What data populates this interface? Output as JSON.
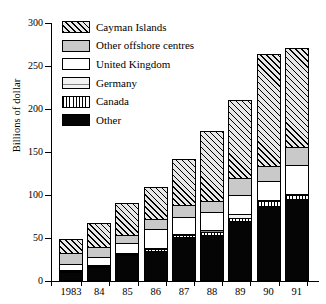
{
  "chart_data": {
    "type": "bar",
    "subtype": "stacked-bar",
    "title": "",
    "xlabel": "",
    "ylabel": "Billions of dollar",
    "categories": [
      "1983",
      "84",
      "85",
      "86",
      "87",
      "88",
      "89",
      "90",
      "91"
    ],
    "ylim": [
      0,
      300
    ],
    "yticks": [
      0,
      50,
      100,
      150,
      200,
      250,
      300
    ],
    "ytick_labels": [
      "0",
      "50",
      "100",
      "150",
      "200",
      "250",
      "300"
    ],
    "grid": false,
    "legend_position": "upper-left-inside",
    "stack_order_bottom_to_top": [
      "Other",
      "Canada",
      "Germany",
      "United Kingdom",
      "Other offshore centres",
      "Cayman Islands"
    ],
    "series": [
      {
        "name": "Other",
        "pattern": "solid-black",
        "color": "#050505",
        "values": [
          11,
          16,
          30,
          35,
          51,
          54,
          70,
          87,
          95
        ]
      },
      {
        "name": "Canada",
        "pattern": "vertical-stripes",
        "color": "#ffffff",
        "values": [
          2,
          2,
          3,
          3,
          4,
          4,
          5,
          7,
          6
        ]
      },
      {
        "name": "Germany",
        "pattern": "fine-horizontal-dots",
        "color": "#f2f2f2",
        "values": [
          1,
          1,
          1,
          1,
          1,
          4,
          5,
          1,
          1
        ]
      },
      {
        "name": "United Kingdom",
        "pattern": "white",
        "color": "#ffffff",
        "values": [
          8,
          11,
          12,
          24,
          21,
          22,
          23,
          23,
          35
        ]
      },
      {
        "name": "Other offshore centres",
        "pattern": "solid-grey",
        "color": "#c9c9c9",
        "values": [
          14,
          13,
          11,
          13,
          15,
          14,
          21,
          19,
          22
        ]
      },
      {
        "name": "Cayman Islands",
        "pattern": "diagonal-hatch",
        "color": "#e8e8e8",
        "values": [
          17,
          29,
          38,
          38,
          54,
          82,
          92,
          131,
          116
        ]
      }
    ],
    "totals": [
      53,
      72,
      95,
      114,
      146,
      180,
      216,
      268,
      275
    ]
  },
  "legend": {
    "items": [
      {
        "label": "Cayman Islands",
        "key": "cayman"
      },
      {
        "label": "Other offshore centres",
        "key": "offshore"
      },
      {
        "label": "United Kingdom",
        "key": "uk"
      },
      {
        "label": "Germany",
        "key": "germany"
      },
      {
        "label": "Canada",
        "key": "canada"
      },
      {
        "label": "Other",
        "key": "other"
      }
    ]
  },
  "axis": {
    "y_title": "Billions of dollar"
  }
}
